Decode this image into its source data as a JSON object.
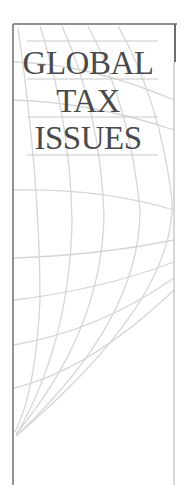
{
  "cover": {
    "title_lines": [
      "GLOBAL",
      "TAX",
      "ISSUES"
    ],
    "colors": {
      "text": "#4a4a4a",
      "frame": "#6e6e6e",
      "grid": "#d6d6d6",
      "rule": "#c8c8c8",
      "background": "#ffffff"
    },
    "graphic": "globe-grid"
  }
}
